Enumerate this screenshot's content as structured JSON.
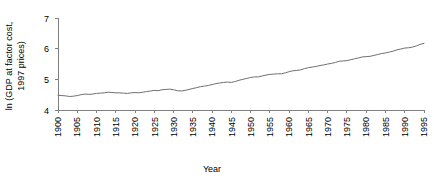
{
  "chart_data": {
    "type": "line",
    "title": "",
    "xlabel": "Year",
    "ylabel": "ln (GDP at factor cost, 1997 prices)",
    "ylabel_line1": "ln (GDP at factor cost,",
    "ylabel_line2": "1997 prices)",
    "xlim": [
      1900,
      1995
    ],
    "ylim": [
      4,
      7
    ],
    "grid": false,
    "legend": null,
    "yticks": [
      "4",
      "5",
      "6",
      "7"
    ],
    "ytick_values": [
      4,
      5,
      6,
      7
    ],
    "xticks": [
      "1900",
      "1905",
      "1910",
      "1915",
      "1920",
      "1925",
      "1930",
      "1935",
      "1940",
      "1945",
      "1950",
      "1955",
      "1960",
      "1965",
      "1970",
      "1975",
      "1980",
      "1985",
      "1990",
      "1995"
    ],
    "xtick_values": [
      1900,
      1905,
      1910,
      1915,
      1920,
      1925,
      1930,
      1935,
      1940,
      1945,
      1950,
      1955,
      1960,
      1965,
      1970,
      1975,
      1980,
      1985,
      1990,
      1995
    ],
    "series": [
      {
        "name": "ln GDP at factor cost (1997 prices)",
        "color": "#707070",
        "x": [
          1900,
          1901,
          1902,
          1903,
          1904,
          1905,
          1906,
          1907,
          1908,
          1909,
          1910,
          1911,
          1912,
          1913,
          1914,
          1915,
          1916,
          1917,
          1918,
          1919,
          1920,
          1921,
          1922,
          1923,
          1924,
          1925,
          1926,
          1927,
          1928,
          1929,
          1930,
          1931,
          1932,
          1933,
          1934,
          1935,
          1936,
          1937,
          1938,
          1939,
          1940,
          1941,
          1942,
          1943,
          1944,
          1945,
          1946,
          1947,
          1948,
          1949,
          1950,
          1951,
          1952,
          1953,
          1954,
          1955,
          1956,
          1957,
          1958,
          1959,
          1960,
          1961,
          1962,
          1963,
          1964,
          1965,
          1966,
          1967,
          1968,
          1969,
          1970,
          1971,
          1972,
          1973,
          1974,
          1975,
          1976,
          1977,
          1978,
          1979,
          1980,
          1981,
          1982,
          1983,
          1984,
          1985,
          1986,
          1987,
          1988,
          1989,
          1990,
          1991,
          1992,
          1993,
          1994,
          1995
        ],
        "y": [
          4.48,
          4.47,
          4.46,
          4.44,
          4.45,
          4.47,
          4.5,
          4.52,
          4.51,
          4.52,
          4.54,
          4.55,
          4.56,
          4.58,
          4.57,
          4.56,
          4.56,
          4.55,
          4.54,
          4.56,
          4.57,
          4.56,
          4.58,
          4.6,
          4.62,
          4.64,
          4.63,
          4.66,
          4.67,
          4.68,
          4.66,
          4.63,
          4.62,
          4.64,
          4.67,
          4.7,
          4.73,
          4.76,
          4.78,
          4.8,
          4.83,
          4.86,
          4.88,
          4.9,
          4.91,
          4.9,
          4.93,
          4.97,
          5.0,
          5.03,
          5.06,
          5.08,
          5.08,
          5.11,
          5.14,
          5.16,
          5.17,
          5.18,
          5.18,
          5.21,
          5.25,
          5.28,
          5.29,
          5.31,
          5.35,
          5.38,
          5.4,
          5.42,
          5.45,
          5.47,
          5.5,
          5.52,
          5.55,
          5.59,
          5.6,
          5.61,
          5.64,
          5.67,
          5.7,
          5.73,
          5.74,
          5.75,
          5.78,
          5.81,
          5.84,
          5.86,
          5.89,
          5.92,
          5.96,
          5.99,
          6.02,
          6.03,
          6.05,
          6.09,
          6.14,
          6.17
        ]
      }
    ]
  }
}
